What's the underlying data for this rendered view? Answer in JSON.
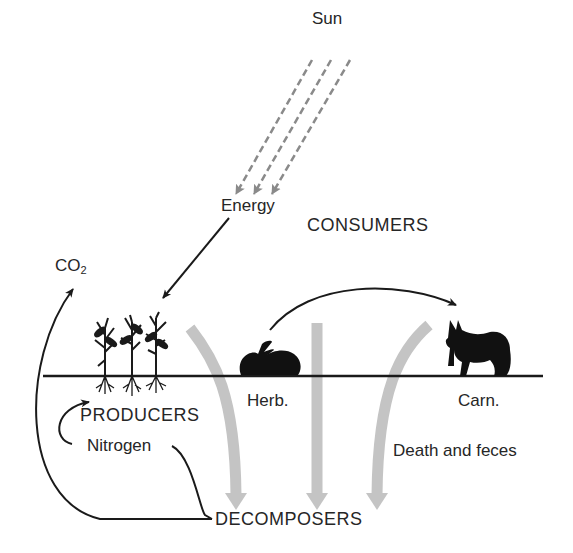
{
  "diagram": {
    "labels": {
      "sun": "Sun",
      "energy": "Energy",
      "consumers": "CONSUMERS",
      "co2_main": "CO",
      "co2_sub": "2",
      "producers": "PRODUCERS",
      "nitrogen": "Nitrogen",
      "herbivore": "Herb.",
      "carnivore": "Carn.",
      "death_feces": "Death and feces",
      "decomposers": "DECOMPOSERS"
    },
    "nodes": [
      "Sun",
      "Producers",
      "Herbivore",
      "Carnivore",
      "Decomposers"
    ],
    "flows": [
      {
        "from": "Sun",
        "to": "Producers",
        "type": "energy",
        "style": "dashed-gray"
      },
      {
        "from": "Herbivore",
        "to": "Carnivore",
        "type": "consumption",
        "style": "solid-black"
      },
      {
        "from": "Producers",
        "to": "Decomposers",
        "type": "death and feces",
        "style": "gray-wide"
      },
      {
        "from": "Herbivore",
        "to": "Decomposers",
        "type": "death and feces",
        "style": "gray-wide"
      },
      {
        "from": "Carnivore",
        "to": "Decomposers",
        "type": "death and feces",
        "style": "gray-wide"
      },
      {
        "from": "Decomposers",
        "to": "CO2",
        "type": "respiration",
        "style": "solid-black"
      },
      {
        "from": "Decomposers",
        "to": "Producers",
        "type": "nitrogen",
        "style": "solid-black"
      }
    ],
    "colors": {
      "ink": "#1a1a1a",
      "gray_arrow": "#c4c4c4",
      "dashed_ray": "#8a8a8a"
    }
  }
}
